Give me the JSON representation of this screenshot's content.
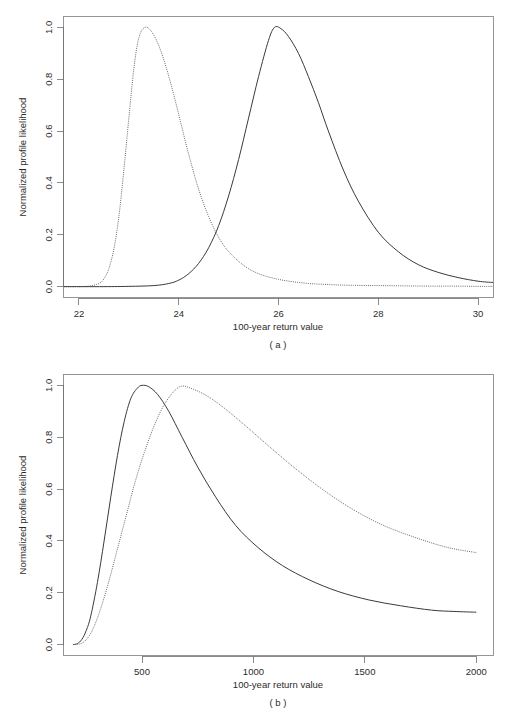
{
  "figure": {
    "background_color": "#ffffff",
    "solid_color": "#3a3a3a",
    "dotted_color": "#6a6a6a",
    "axis_color": "#6e6e6e"
  },
  "panels": [
    {
      "id": "a",
      "caption": "( a )",
      "xlabel": "100-year return value",
      "ylabel": "Normalized profile likelihood"
    },
    {
      "id": "b",
      "caption": "( b )",
      "xlabel": "100-year return value",
      "ylabel": "Normalized profile likelihood"
    }
  ],
  "chart_data": [
    {
      "type": "line",
      "panel": "a",
      "title": "",
      "xlabel": "100-year return value",
      "ylabel": "Normalized profile likelihood",
      "xlim": [
        21.7,
        30.3
      ],
      "ylim": [
        -0.04,
        1.04
      ],
      "xticks": [
        22,
        24,
        26,
        28,
        30
      ],
      "xtick_labels": [
        "22",
        "24",
        "26",
        "28",
        "30"
      ],
      "yticks": [
        0.0,
        0.2,
        0.4,
        0.6,
        0.8,
        1.0
      ],
      "ytick_labels": [
        "0.0",
        "0.2",
        "0.4",
        "0.6",
        "0.8",
        "1.0"
      ],
      "grid": false,
      "legend": "none",
      "series": [
        {
          "name": "dotted-profile-a",
          "style": "dotted",
          "peak_x": 23.32,
          "peak_y": 1.0,
          "x": [
            21.7,
            22.0,
            22.2,
            22.4,
            22.5,
            22.6,
            22.7,
            22.8,
            22.9,
            23.0,
            23.1,
            23.2,
            23.32,
            23.45,
            23.6,
            23.75,
            23.9,
            24.05,
            24.2,
            24.4,
            24.6,
            24.8,
            25.0,
            25.3,
            25.6,
            26.0,
            26.5,
            27.0,
            27.5,
            28.0,
            28.5,
            29.0,
            29.5,
            30.0,
            30.3
          ],
          "y": [
            0.0,
            0.0,
            0.002,
            0.012,
            0.03,
            0.07,
            0.145,
            0.27,
            0.45,
            0.65,
            0.84,
            0.96,
            1.0,
            0.985,
            0.93,
            0.845,
            0.74,
            0.625,
            0.51,
            0.375,
            0.27,
            0.19,
            0.135,
            0.082,
            0.05,
            0.028,
            0.014,
            0.008,
            0.005,
            0.004,
            0.003,
            0.002,
            0.002,
            0.001,
            0.001
          ]
        },
        {
          "name": "solid-profile-a",
          "style": "solid",
          "peak_x": 25.92,
          "peak_y": 1.0,
          "x": [
            21.7,
            22.5,
            23.0,
            23.5,
            23.8,
            24.0,
            24.2,
            24.4,
            24.6,
            24.8,
            25.0,
            25.2,
            25.4,
            25.6,
            25.8,
            25.92,
            26.05,
            26.2,
            26.4,
            26.6,
            26.8,
            27.0,
            27.3,
            27.6,
            28.0,
            28.4,
            28.8,
            29.2,
            29.6,
            30.0,
            30.3
          ],
          "y": [
            0.0,
            0.0,
            0.001,
            0.004,
            0.012,
            0.025,
            0.05,
            0.09,
            0.15,
            0.235,
            0.35,
            0.49,
            0.65,
            0.81,
            0.95,
            1.0,
            0.995,
            0.965,
            0.9,
            0.81,
            0.71,
            0.6,
            0.45,
            0.33,
            0.21,
            0.135,
            0.085,
            0.055,
            0.035,
            0.021,
            0.016
          ]
        }
      ]
    },
    {
      "type": "line",
      "panel": "b",
      "title": "",
      "xlabel": "100-year return value",
      "ylabel": "Normalized profile likelihood",
      "xlim": [
        150,
        2075
      ],
      "ylim": [
        -0.04,
        1.04
      ],
      "xticks": [
        500,
        1000,
        1500,
        2000
      ],
      "xtick_labels": [
        "500",
        "1000",
        "1500",
        "2000"
      ],
      "yticks": [
        0.0,
        0.2,
        0.4,
        0.6,
        0.8,
        1.0
      ],
      "ytick_labels": [
        "0.0",
        "0.2",
        "0.4",
        "0.6",
        "0.8",
        "1.0"
      ],
      "grid": false,
      "legend": "none",
      "series": [
        {
          "name": "solid-profile-b",
          "style": "solid",
          "peak_x": 500,
          "peak_y": 1.0,
          "x": [
            190,
            210,
            230,
            250,
            270,
            300,
            330,
            360,
            390,
            420,
            450,
            480,
            500,
            530,
            570,
            620,
            680,
            750,
            830,
            920,
            1020,
            1130,
            1250,
            1380,
            1520,
            1660,
            1800,
            1900,
            2000
          ],
          "y": [
            0.0,
            0.004,
            0.02,
            0.055,
            0.11,
            0.24,
            0.4,
            0.57,
            0.73,
            0.86,
            0.95,
            0.99,
            1.0,
            0.995,
            0.965,
            0.9,
            0.8,
            0.685,
            0.57,
            0.46,
            0.375,
            0.305,
            0.25,
            0.205,
            0.172,
            0.15,
            0.133,
            0.128,
            0.125
          ]
        },
        {
          "name": "dotted-profile-b",
          "style": "dotted",
          "peak_x": 670,
          "peak_y": 0.995,
          "x": [
            210,
            235,
            260,
            285,
            315,
            350,
            390,
            430,
            470,
            510,
            560,
            610,
            670,
            730,
            800,
            880,
            970,
            1070,
            1180,
            1300,
            1430,
            1570,
            1720,
            1870,
            2000
          ],
          "y": [
            0.0,
            0.008,
            0.03,
            0.07,
            0.14,
            0.24,
            0.37,
            0.5,
            0.63,
            0.74,
            0.855,
            0.94,
            0.995,
            0.985,
            0.955,
            0.905,
            0.84,
            0.765,
            0.685,
            0.605,
            0.53,
            0.465,
            0.415,
            0.375,
            0.355
          ]
        }
      ]
    }
  ]
}
